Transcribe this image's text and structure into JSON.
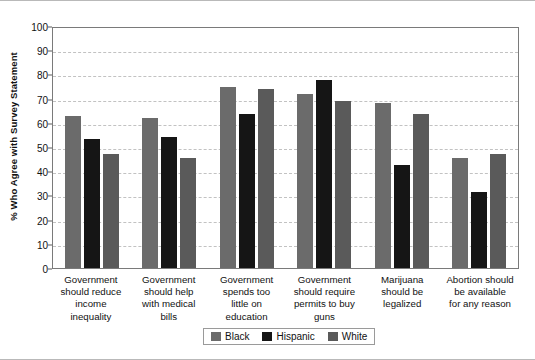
{
  "chart_data": {
    "type": "bar",
    "title": "",
    "xlabel": "",
    "ylabel": "% Who Agree with Survey Statement",
    "ylim": [
      0,
      100
    ],
    "yticks": [
      0,
      10,
      20,
      30,
      40,
      50,
      60,
      70,
      80,
      90,
      100
    ],
    "grid": true,
    "legend_position": "bottom-center",
    "categories": [
      "Government should reduce income inequality",
      "Government should help with medical bills",
      "Government spends too little on education",
      "Government should require permits to buy guns",
      "Marijuana should be legalized",
      "Abortion should be available for any reason"
    ],
    "category_lines": [
      [
        "Government",
        "should reduce",
        "income",
        "inequality"
      ],
      [
        "Government",
        "should help",
        "with medical",
        "bills"
      ],
      [
        "Government",
        "spends too",
        "little on",
        "education"
      ],
      [
        "Government",
        "should require",
        "permits to buy",
        "guns"
      ],
      [
        "Marijuana",
        "should be",
        "legalized"
      ],
      [
        "Abortion should",
        "be available",
        "for any reason"
      ]
    ],
    "series": [
      {
        "name": "Black",
        "color": "#6b6b6b",
        "values": [
          63,
          62,
          75,
          72,
          68,
          45.5
        ]
      },
      {
        "name": "Hispanic",
        "color": "#151515",
        "values": [
          53.5,
          54,
          63.5,
          77.5,
          42.5,
          31.5
        ]
      },
      {
        "name": "White",
        "color": "#5a5a5a",
        "values": [
          47,
          45.5,
          74,
          69,
          63.5,
          47
        ]
      }
    ]
  },
  "legend": {
    "items": [
      {
        "label": "Black",
        "color": "#6b6b6b"
      },
      {
        "label": "Hispanic",
        "color": "#151515"
      },
      {
        "label": "White",
        "color": "#5a5a5a"
      }
    ]
  }
}
